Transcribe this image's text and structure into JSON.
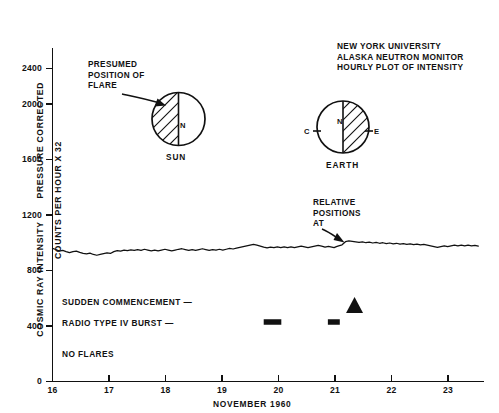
{
  "figure": {
    "title_block": [
      "NEW YORK UNIVERSITY",
      "ALASKA NEUTRON MONITOR",
      "HOURLY PLOT OF INTENSITY"
    ],
    "ylabel_segments": [
      "COSMIC RAY INTENSITY",
      "PRESSURE CORRECTED",
      "COUNTS PER HOUR X 32"
    ],
    "xlabel": "NOVEMBER 1960",
    "colors": {
      "ink": "#111111",
      "background": "#ffffff"
    }
  },
  "annotations": {
    "presumed_flare": [
      "PRESUMED",
      "POSITION OF",
      "FLARE"
    ],
    "relative_positions": [
      "RELATIVE",
      "POSITIONS",
      "AT"
    ],
    "sun_label": "SUN",
    "earth_label": "EARTH",
    "sun_pole": "N",
    "earth_pole": "N",
    "earth_left_tick": "C",
    "earth_right_tick": "E"
  },
  "events": {
    "sudden_commencement_label": "SUDDEN COMMENCEMENT —",
    "radio_burst_label": "RADIO TYPE IV BURST —",
    "no_flares_label": "NO FLARES"
  },
  "chart_data": {
    "type": "line",
    "xlabel": "NOVEMBER 1960",
    "ylabel": "COSMIC RAY INTENSITY PRESSURE CORRECTED COUNTS PER HOUR X 32",
    "xlim": [
      16,
      23.6
    ],
    "ylim": [
      0,
      2650
    ],
    "xticks": [
      16,
      17,
      18,
      19,
      20,
      21,
      22,
      23
    ],
    "xticklabels": [
      "16",
      "17",
      "18",
      "19",
      "20",
      "21",
      "22",
      "23"
    ],
    "yticks": [
      0,
      400,
      800,
      1200,
      1600,
      2000,
      2400
    ],
    "yticklabels": [
      "0",
      "400",
      "800",
      "1200",
      "1600",
      "2000",
      "2400"
    ],
    "grid": false,
    "legend": null,
    "series": [
      {
        "name": "Cosmic ray intensity (hourly)",
        "x": [
          16.0,
          16.06,
          16.12,
          16.18,
          16.24,
          16.3,
          16.36,
          16.42,
          16.48,
          16.54,
          16.6,
          16.66,
          16.72,
          16.78,
          16.84,
          16.9,
          16.96,
          17.02,
          17.08,
          17.14,
          17.2,
          17.26,
          17.32,
          17.38,
          17.44,
          17.5,
          17.56,
          17.62,
          17.68,
          17.74,
          17.8,
          17.86,
          17.92,
          17.98,
          18.04,
          18.1,
          18.16,
          18.22,
          18.28,
          18.34,
          18.4,
          18.46,
          18.52,
          18.58,
          18.64,
          18.7,
          18.76,
          18.82,
          18.88,
          18.94,
          19.0,
          19.06,
          19.12,
          19.18,
          19.24,
          19.3,
          19.36,
          19.42,
          19.48,
          19.54,
          19.6,
          19.66,
          19.72,
          19.78,
          19.84,
          19.9,
          19.96,
          20.02,
          20.08,
          20.14,
          20.2,
          20.26,
          20.32,
          20.38,
          20.44,
          20.5,
          20.56,
          20.62,
          20.68,
          20.74,
          20.8,
          20.86,
          20.92,
          20.96,
          21.0,
          21.04,
          21.1,
          21.16,
          21.22,
          21.28,
          21.34,
          21.4,
          21.46,
          21.52,
          21.58,
          21.64,
          21.7,
          21.76,
          21.82,
          21.88,
          21.94,
          22.0,
          22.06,
          22.12,
          22.18,
          22.24,
          22.3,
          22.36,
          22.42,
          22.48,
          22.54,
          22.6,
          22.66,
          22.72,
          22.78,
          22.84,
          22.9,
          22.96,
          23.02,
          23.08,
          23.14,
          23.2,
          23.26,
          23.32,
          23.38,
          23.44,
          23.5
        ],
        "y": [
          1020,
          1012,
          1000,
          1005,
          996,
          988,
          996,
          1000,
          990,
          982,
          978,
          984,
          974,
          968,
          974,
          980,
          986,
          982,
          996,
          1004,
          1000,
          1008,
          1004,
          1010,
          1006,
          1012,
          1006,
          1014,
          1008,
          1002,
          1008,
          1002,
          1008,
          1014,
          1008,
          1002,
          1008,
          1014,
          1018,
          1012,
          1006,
          1012,
          1006,
          1012,
          1018,
          1012,
          1006,
          1012,
          1008,
          1014,
          1008,
          1014,
          1020,
          1016,
          1022,
          1028,
          1034,
          1040,
          1046,
          1052,
          1046,
          1038,
          1030,
          1024,
          1030,
          1026,
          1032,
          1026,
          1032,
          1026,
          1032,
          1026,
          1032,
          1038,
          1032,
          1026,
          1032,
          1038,
          1044,
          1038,
          1030,
          1036,
          1030,
          1026,
          1034,
          1040,
          1048,
          1072,
          1078,
          1074,
          1070,
          1066,
          1070,
          1064,
          1068,
          1062,
          1066,
          1060,
          1064,
          1058,
          1062,
          1056,
          1060,
          1054,
          1058,
          1052,
          1056,
          1050,
          1054,
          1048,
          1052,
          1046,
          1040,
          1034,
          1028,
          1034,
          1040,
          1034,
          1040,
          1046,
          1040,
          1046,
          1040,
          1046,
          1040,
          1044,
          1038
        ]
      }
    ],
    "markers": [
      {
        "name": "sudden-commencement-triangle",
        "type": "triangle",
        "x": 21.32,
        "y_px": 305
      },
      {
        "name": "radio-burst-bar-1",
        "type": "bar",
        "x_start": 19.72,
        "x_end": 20.03,
        "y_px": 322
      },
      {
        "name": "radio-burst-bar-2",
        "type": "bar",
        "x_start": 20.85,
        "x_end": 21.06,
        "y_px": 322
      }
    ]
  }
}
